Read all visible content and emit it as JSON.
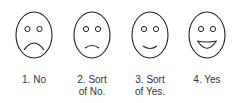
{
  "colors": {
    "stroke": "#222222",
    "text": "#333333",
    "background": "#ffffff"
  },
  "faces": [
    {
      "id": 1,
      "label": "1. No",
      "expression": "frown",
      "center_x": 34
    },
    {
      "id": 2,
      "label": "2. Sort\nof No.",
      "expression": "slight-frown",
      "center_x": 92
    },
    {
      "id": 3,
      "label": "3. Sort\nof Yes.",
      "expression": "slight-smile",
      "center_x": 150
    },
    {
      "id": 4,
      "label": "4. Yes",
      "expression": "big-smile",
      "center_x": 207
    }
  ]
}
